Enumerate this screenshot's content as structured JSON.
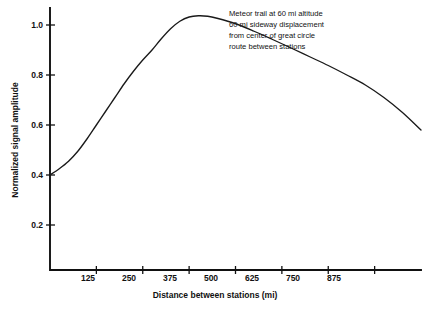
{
  "chart_data": {
    "type": "line",
    "title": "",
    "subtitle": "",
    "xlabel": "Distance between stations (mi)",
    "ylabel": "Normalized signal amplitude",
    "xlim": [
      0,
      1000
    ],
    "ylim": [
      0,
      1.12
    ],
    "grid": false,
    "legend": null,
    "xticks": [
      125,
      250,
      375,
      500,
      625,
      750,
      875
    ],
    "xtick_labels": [
      "125",
      "250",
      "375",
      "500",
      "625",
      "750",
      "875"
    ],
    "yticks": [
      0.2,
      0.4,
      0.6,
      0.8,
      1.0
    ],
    "ytick_labels": [
      "0.2",
      "0.4",
      "0.6",
      "0.8",
      "1.0"
    ],
    "series": [
      {
        "name": "Normalized signal amplitude",
        "x": [
          0,
          25,
          50,
          75,
          100,
          125,
          150,
          175,
          200,
          225,
          250,
          275,
          300,
          325,
          350,
          375,
          400,
          425,
          450,
          500,
          550,
          600,
          650,
          700,
          750,
          800,
          850,
          900,
          950,
          1000
        ],
        "y": [
          0.4,
          0.425,
          0.455,
          0.495,
          0.545,
          0.6,
          0.655,
          0.71,
          0.765,
          0.815,
          0.86,
          0.9,
          0.945,
          0.985,
          1.015,
          1.032,
          1.037,
          1.035,
          1.027,
          1.005,
          0.975,
          0.942,
          0.908,
          0.873,
          0.838,
          0.8,
          0.76,
          0.71,
          0.65,
          0.58
        ]
      }
    ],
    "annotations": [
      {
        "name": "meteor-trail-note",
        "lines": [
          "Meteor trail at 60 mi altitude",
          "60 mi sideway displacement",
          "from center of great circle",
          "route between stations"
        ]
      }
    ]
  },
  "axes": {
    "x_title": "Distance between stations (mi)",
    "y_title": "Normalized signal amplitude"
  },
  "ticks": {
    "x": [
      "125",
      "250",
      "375",
      "500",
      "625",
      "750",
      "875"
    ],
    "y": [
      "0.2",
      "0.4",
      "0.6",
      "0.8",
      "1.0"
    ]
  },
  "annotation": {
    "line1": "Meteor trail at 60 mi altitude",
    "line2": "60 mi sideway displacement",
    "line3": "from center of great circle",
    "line4": "route between stations"
  },
  "colors": {
    "background": "#ffffff",
    "axis": "#111111",
    "curve": "#1a1a1a",
    "text": "#111111"
  }
}
